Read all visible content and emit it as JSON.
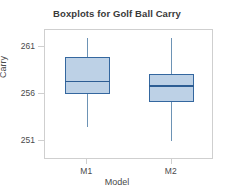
{
  "chart_data": {
    "type": "box",
    "title": "Boxplots for Golf Ball Carry",
    "xlabel": "Model",
    "ylabel": "Carry",
    "categories": [
      "M1",
      "M2"
    ],
    "ylim": [
      249.0,
      262.8
    ],
    "yticks": [
      251,
      256,
      261
    ],
    "ytick_labels": [
      "251",
      "256",
      "261"
    ],
    "grid": false,
    "legend": "none",
    "boxes": [
      {
        "name": "M1",
        "whisker_low": 252.5,
        "q1": 256.05,
        "median": 257.35,
        "q3": 259.95,
        "whisker_high": 262.0
      },
      {
        "name": "M2",
        "whisker_low": 251.05,
        "q1": 255.2,
        "median": 256.85,
        "q3": 258.1,
        "whisker_high": 262.0
      }
    ],
    "colors": {
      "box_fill": "#bdd1e6",
      "box_border": "#34679f",
      "median": "#2d5d93",
      "whisker": "#6d93b5",
      "frame": "#cfcfcf",
      "text": "#4a4a4a",
      "title_text": "#3a3a3a"
    }
  }
}
